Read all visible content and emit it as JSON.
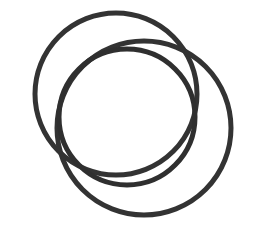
{
  "canvas": {
    "width": 260,
    "height": 238,
    "background_color": "#ffffff",
    "title": "Three interlocking rings line drawing"
  },
  "drawing": {
    "name": "three-interlocking-rings",
    "description": "Black outline sketch of three overlapping circles arranged in a triangular interlocking (Borromean-style) pattern on a plain white background",
    "stroke_color": "#333333",
    "stroke_width": 5,
    "fill": "none",
    "shape_count": 3,
    "shapes": [
      {
        "name": "ring-upper-left",
        "type": "circle",
        "cx": 116,
        "cy": 94,
        "r": 81,
        "rotation": 0,
        "stroke_color": "#333333",
        "stroke_width": 5
      },
      {
        "name": "ring-lower-right",
        "type": "circle",
        "cx": 144,
        "cy": 128,
        "r": 87,
        "rotation": 0,
        "stroke_color": "#333333",
        "stroke_width": 5
      },
      {
        "name": "ring-front-center",
        "type": "circle",
        "cx": 127,
        "cy": 117,
        "r": 68,
        "rotation": 0,
        "stroke_color": "#2f2f2f",
        "stroke_width": 5
      }
    ],
    "crossing_points": [
      {
        "name": "crossing-top-left",
        "x": 105,
        "y": 62
      },
      {
        "name": "crossing-top-right",
        "x": 163,
        "y": 32
      },
      {
        "name": "crossing-left",
        "x": 55,
        "y": 143
      },
      {
        "name": "crossing-bottom-center",
        "x": 118,
        "y": 167
      },
      {
        "name": "crossing-right",
        "x": 203,
        "y": 178
      },
      {
        "name": "crossing-mid-right",
        "x": 197,
        "y": 115
      }
    ]
  }
}
